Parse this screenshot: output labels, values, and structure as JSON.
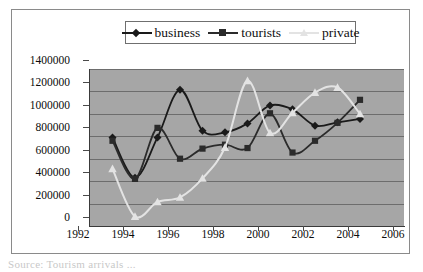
{
  "figure": {
    "background_color": "#ffffff",
    "plot_background_color": "#a6a6a6",
    "frame_color": "#8a8a8a",
    "caption_partial": "Source: Tourism arrivals ..."
  },
  "legend": {
    "position": "top-center",
    "entries": [
      {
        "label": "business",
        "marker": "diamond",
        "color": "#1a1a1a"
      },
      {
        "label": "tourists",
        "marker": "square",
        "color": "#2b2b2b"
      },
      {
        "label": "private",
        "marker": "triangle",
        "color": "#e3e3e3"
      }
    ]
  },
  "axes": {
    "y_ticks": [
      "0",
      "200000",
      "400000",
      "600000",
      "800000",
      "1000000",
      "1200000",
      "1400000"
    ],
    "x_ticks": [
      "1992",
      "1994",
      "1996",
      "1998",
      "2000",
      "2002",
      "2004",
      "2006"
    ]
  },
  "chart_data": {
    "type": "line",
    "title": "",
    "subtitle": "",
    "xlabel": "",
    "ylabel": "",
    "xlim": [
      1992,
      2006
    ],
    "ylim": [
      0,
      1400000
    ],
    "y_tick_step": 200000,
    "x_tick_step": 2,
    "grid": true,
    "legend_position": "top-center",
    "x": [
      1993,
      1994,
      1995,
      1996,
      1997,
      1998,
      1999,
      2000,
      2001,
      2002,
      2003,
      2004
    ],
    "series": [
      {
        "name": "business",
        "marker": "diamond",
        "color": "#1a1a1a",
        "values": [
          790000,
          430000,
          790000,
          1215000,
          850000,
          835000,
          915000,
          1075000,
          1040000,
          895000,
          925000,
          955000
        ]
      },
      {
        "name": "tourists",
        "marker": "square",
        "color": "#2b2b2b",
        "values": [
          760000,
          420000,
          875000,
          600000,
          690000,
          725000,
          695000,
          1005000,
          655000,
          760000,
          920000,
          1125000
        ]
      },
      {
        "name": "private",
        "marker": "triangle",
        "color": "#e3e3e3",
        "values": [
          510000,
          85000,
          215000,
          255000,
          425000,
          700000,
          1295000,
          830000,
          1010000,
          1190000,
          1235000,
          1000000
        ]
      }
    ]
  }
}
